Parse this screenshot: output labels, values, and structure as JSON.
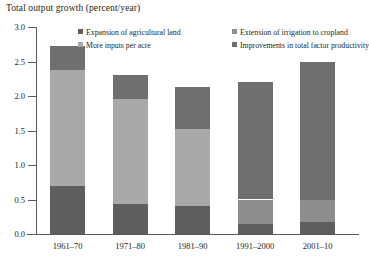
{
  "chart_data": {
    "type": "bar",
    "stacked": true,
    "title": "Total output growth (percent/year)",
    "xlabel": "",
    "ylabel": "Total output growth (percent/year)",
    "ylim": [
      0.0,
      3.0
    ],
    "ytick_labels": [
      "0.0",
      "0.5",
      "1.0",
      "1.5",
      "2.0",
      "2.5",
      "3.0"
    ],
    "ytick_values": [
      0.0,
      0.5,
      1.0,
      1.5,
      2.0,
      2.5,
      3.0
    ],
    "grid": false,
    "legend_position": "top-inside",
    "categories": [
      "1961–70",
      "1971–80",
      "1981–90",
      "1991–2000",
      "2001–10"
    ],
    "series": [
      {
        "name": "Expansion of agricultural land",
        "color": "#5d5e60",
        "values": [
          0.7,
          0.44,
          0.4,
          0.15,
          0.18
        ]
      },
      {
        "name": "Extension of irrigation to cropland",
        "color": "#8c8d8f",
        "values": [
          0.0,
          0.0,
          0.0,
          0.35,
          0.32
        ]
      },
      {
        "name": "More inputs per acre",
        "color": "#a8a9ab",
        "values": [
          1.67,
          1.52,
          1.12,
          0.0,
          0.0
        ]
      },
      {
        "name": "Improvements in total factor productivity",
        "color": "#6e6f71",
        "values": [
          0.36,
          0.35,
          0.61,
          1.71,
          2.0
        ]
      }
    ],
    "totals": [
      2.73,
      2.31,
      2.13,
      2.21,
      2.5
    ]
  },
  "legend": {
    "items": [
      {
        "label": "Expansion of agricultural land",
        "color": "#5d5e60"
      },
      {
        "label": "More inputs per acre",
        "color": "#a8a9ab"
      },
      {
        "label": "Extension of irrigation to cropland",
        "color": "#8c8d8f"
      },
      {
        "label": "Improvements in total factor productivity",
        "color": "#6e6f71"
      }
    ]
  },
  "axis": {
    "line_color": "#58595b"
  }
}
